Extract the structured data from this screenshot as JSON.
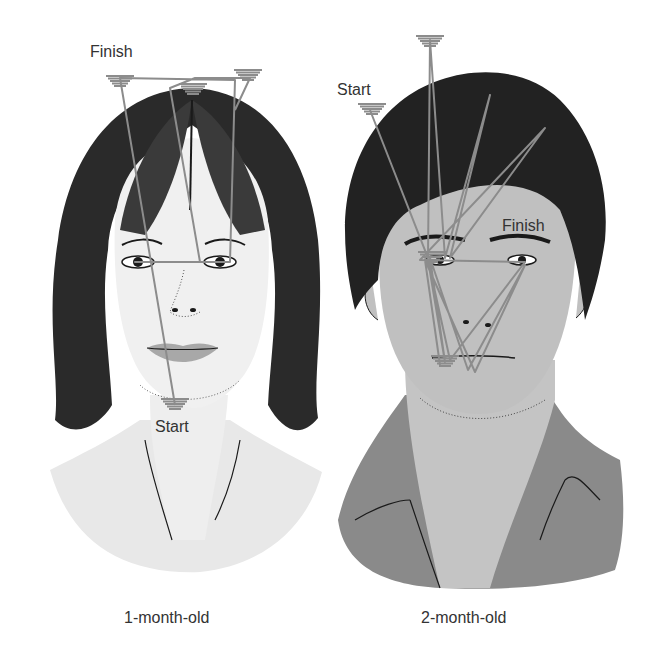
{
  "figure": {
    "panels": [
      {
        "id": "left",
        "caption": "1-month-old",
        "subject": "woman-face",
        "labels": {
          "finish": "Finish",
          "start": "Start"
        },
        "scan_path": [
          [
            175,
            405
          ],
          [
            120,
            78
          ],
          [
            235,
            80
          ],
          [
            230,
            262
          ],
          [
            135,
            262
          ],
          [
            200,
            262
          ],
          [
            170,
            88
          ],
          [
            195,
            78
          ],
          [
            250,
            78
          ],
          [
            235,
            110
          ]
        ],
        "fixation_clusters": [
          [
            120,
            80
          ],
          [
            193,
            88
          ],
          [
            248,
            74
          ],
          [
            175,
            403
          ]
        ]
      },
      {
        "id": "right",
        "caption": "2-month-old",
        "subject": "man-face",
        "labels": {
          "start": "Start",
          "finish": "Finish"
        },
        "scan_path": [
          [
            370,
            110
          ],
          [
            428,
            258
          ],
          [
            430,
            40
          ],
          [
            445,
            258
          ],
          [
            490,
            95
          ],
          [
            450,
            258
          ],
          [
            545,
            128
          ],
          [
            420,
            260
          ],
          [
            525,
            262
          ],
          [
            450,
            360
          ],
          [
            428,
            260
          ],
          [
            445,
            362
          ],
          [
            430,
            258
          ],
          [
            468,
            370
          ],
          [
            525,
            265
          ],
          [
            475,
            372
          ],
          [
            425,
            260
          ],
          [
            440,
            365
          ]
        ],
        "fixation_clusters": [
          [
            372,
            108
          ],
          [
            430,
            40
          ],
          [
            432,
            256
          ],
          [
            445,
            360
          ]
        ]
      }
    ],
    "colors": {
      "path": "#8c8c8c",
      "text": "#333333",
      "skin_left": "#ececec",
      "skin_right": "#bdbdbd",
      "hair_left": "#1a1a1a",
      "hair_right": "#1e1e1e",
      "shirt_left": "#e6e6e6",
      "shirt_right": "#8a8a8a",
      "lips": "#a8a8a8"
    }
  }
}
